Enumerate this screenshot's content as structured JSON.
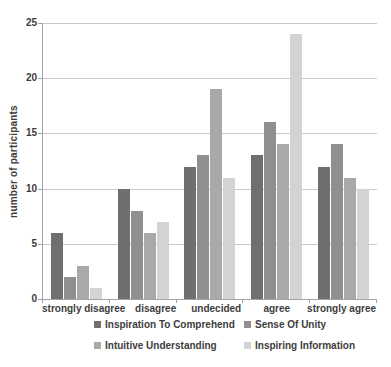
{
  "chart_data": {
    "type": "bar",
    "title": "",
    "xlabel": "",
    "ylabel": "number of participants",
    "categories": [
      "strongly disagree",
      "disagree",
      "undecided",
      "agree",
      "strongly agree"
    ],
    "series": [
      {
        "name": "Inspiration To Comprehend",
        "color": "#6f6f6f",
        "values": [
          6,
          10,
          12,
          13,
          12
        ]
      },
      {
        "name": "Sense Of Unity",
        "color": "#8f8f8f",
        "values": [
          2,
          8,
          13,
          16,
          14
        ]
      },
      {
        "name": "Intuitive Understanding",
        "color": "#a9a9a9",
        "values": [
          3,
          6,
          19,
          14,
          11
        ]
      },
      {
        "name": "Inspiring Information",
        "color": "#d3d3d3",
        "values": [
          1,
          7,
          11,
          24,
          10
        ]
      }
    ],
    "ylim": [
      0,
      25
    ],
    "yticks": [
      0,
      5,
      10,
      15,
      20,
      25
    ],
    "grid": true,
    "legend_position": "bottom",
    "axis_color": "#a3a3a3",
    "gridline_color": "#c9c9c9",
    "text_color": "#3d3d3d"
  }
}
